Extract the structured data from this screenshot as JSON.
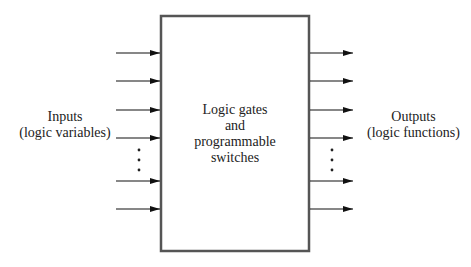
{
  "diagram": {
    "inputs_label": [
      "Inputs",
      "(logic variables)"
    ],
    "outputs_label": [
      "Outputs",
      "(logic functions)"
    ],
    "block_label": [
      "Logic gates",
      "and",
      "programmable",
      "switches"
    ],
    "input_arrow_count": 6,
    "output_arrow_count": 6,
    "ellipsis": "vertical-dots",
    "colors": {
      "stroke": "#555555",
      "arrow": "#111111",
      "text": "#222222"
    }
  }
}
